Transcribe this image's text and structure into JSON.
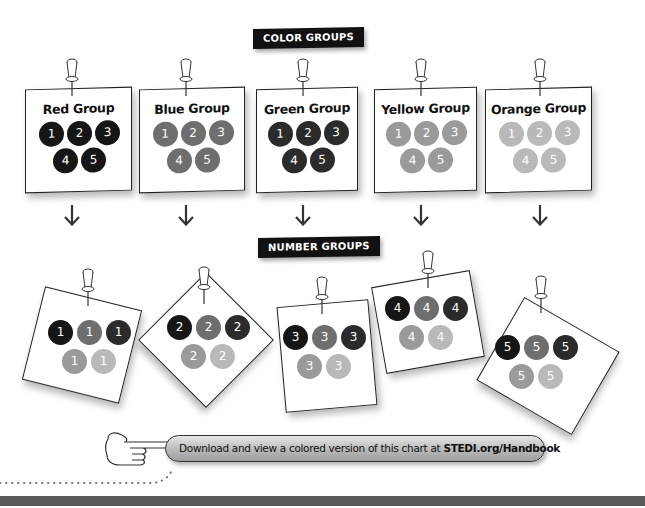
{
  "banners": {
    "color_groups": "COLOR GROUPS",
    "number_groups": "NUMBER GROUPS"
  },
  "color_groups": [
    {
      "title": "Red Group",
      "numbers": [
        "1",
        "2",
        "3",
        "4",
        "5"
      ],
      "dot_color": "#161616"
    },
    {
      "title": "Blue Group",
      "numbers": [
        "1",
        "2",
        "3",
        "4",
        "5"
      ],
      "dot_color": "#6e6e6e"
    },
    {
      "title": "Green Group",
      "numbers": [
        "1",
        "2",
        "3",
        "4",
        "5"
      ],
      "dot_color": "#2b2b2b"
    },
    {
      "title": "Yellow Group",
      "numbers": [
        "1",
        "2",
        "3",
        "4",
        "5"
      ],
      "dot_color": "#9a9a9a"
    },
    {
      "title": "Orange Group",
      "numbers": [
        "1",
        "2",
        "3",
        "4",
        "5"
      ],
      "dot_color": "#b9b9b9"
    }
  ],
  "number_groups": [
    {
      "number": "1",
      "dot_colors": [
        "#161616",
        "#6e6e6e",
        "#2b2b2b",
        "#9a9a9a",
        "#b9b9b9"
      ]
    },
    {
      "number": "2",
      "dot_colors": [
        "#161616",
        "#6e6e6e",
        "#2b2b2b",
        "#9a9a9a",
        "#b9b9b9"
      ]
    },
    {
      "number": "3",
      "dot_colors": [
        "#161616",
        "#6e6e6e",
        "#2b2b2b",
        "#9a9a9a",
        "#b9b9b9"
      ]
    },
    {
      "number": "4",
      "dot_colors": [
        "#161616",
        "#6e6e6e",
        "#2b2b2b",
        "#9a9a9a",
        "#b9b9b9"
      ]
    },
    {
      "number": "5",
      "dot_colors": [
        "#161616",
        "#6e6e6e",
        "#2b2b2b",
        "#9a9a9a",
        "#b9b9b9"
      ]
    }
  ],
  "arrows": [
    "down-arrow",
    "down-arrow",
    "down-arrow",
    "down-arrow",
    "down-arrow"
  ],
  "footer": {
    "download_text": "Download and view a colored version of this chart at ",
    "download_link": "STEDI.org/Handbook"
  }
}
